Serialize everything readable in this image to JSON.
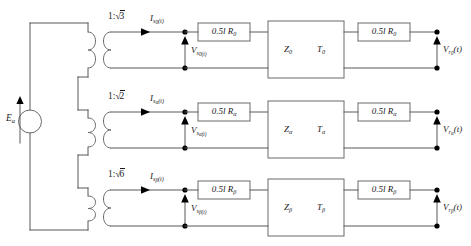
{
  "figure": {
    "kind": "circuit-schematic",
    "colors": {
      "wire": "#58585a",
      "box_stroke": "#6a6a6c",
      "node": "#000000",
      "background": "#ffffff",
      "text": "#1a1a1a"
    }
  },
  "source": {
    "name": "voltage-source",
    "label": "E",
    "sub": "a",
    "symbol": "circle",
    "arrow_direction": "up"
  },
  "rows": [
    {
      "id": "row-zero",
      "transformer_ratio": "1:",
      "transformer_radicand": "3",
      "current_label": "I",
      "current_sub": "s",
      "current_sub_sub": "0",
      "current_suffix": "(t)",
      "secondary_voltage_label": "V",
      "secondary_voltage_sub": "s",
      "secondary_voltage_sub_sub": "0(t)",
      "left_resistor": "0.5l R",
      "left_resistor_sub": "0",
      "line_impedance": "Z",
      "line_impedance_sub": "0",
      "line_delay": "T",
      "line_delay_sub": "0",
      "right_resistor": "0.5l R",
      "right_resistor_sub": "0",
      "receiving_voltage_label": "V",
      "receiving_voltage_sub": "r",
      "receiving_voltage_sub_sub": "0",
      "receiving_voltage_suffix": "(t)"
    },
    {
      "id": "row-alpha",
      "transformer_ratio": "1:",
      "transformer_radicand": "2",
      "current_label": "I",
      "current_sub": "s",
      "current_sub_sub": "α",
      "current_suffix": "(t)",
      "secondary_voltage_label": "V",
      "secondary_voltage_sub": "s",
      "secondary_voltage_sub_sub": "α(t)",
      "left_resistor": "0.5l R",
      "left_resistor_sub": "α",
      "line_impedance": "Z",
      "line_impedance_sub": "α",
      "line_delay": "T",
      "line_delay_sub": "α",
      "right_resistor": "0.5l R",
      "right_resistor_sub": "α",
      "receiving_voltage_label": "V",
      "receiving_voltage_sub": "r",
      "receiving_voltage_sub_sub": "α",
      "receiving_voltage_suffix": "(t)"
    },
    {
      "id": "row-beta",
      "transformer_ratio": "1:",
      "transformer_radicand": "6",
      "current_label": "I",
      "current_sub": "s",
      "current_sub_sub": "β",
      "current_suffix": "(t)",
      "secondary_voltage_label": "V",
      "secondary_voltage_sub": "s",
      "secondary_voltage_sub_sub": "β(t)",
      "left_resistor": "0.5l R",
      "left_resistor_sub": "β",
      "line_impedance": "Z",
      "line_impedance_sub": "β",
      "line_delay": "T",
      "line_delay_sub": "β",
      "right_resistor": "0.5l R",
      "right_resistor_sub": "β",
      "receiving_voltage_label": "V",
      "receiving_voltage_sub": "r",
      "receiving_voltage_sub_sub": "β",
      "receiving_voltage_suffix": "(t)"
    }
  ]
}
